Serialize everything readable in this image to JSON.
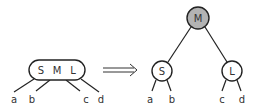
{
  "diagram": {
    "type": "tree-transformation",
    "colors": {
      "stroke": "#222222",
      "node_fill": "#ffffff",
      "root_fill": "#b3b3b3",
      "text": "#333333"
    },
    "left": {
      "node": {
        "keys": [
          "S",
          "M",
          "L"
        ]
      },
      "children": [
        "a",
        "b",
        "c",
        "d"
      ]
    },
    "arrow": {
      "symbol": "⟹"
    },
    "right": {
      "root": {
        "label": "M"
      },
      "left_child": {
        "label": "S",
        "children": [
          "a",
          "b"
        ]
      },
      "right_child": {
        "label": "L",
        "children": [
          "c",
          "d"
        ]
      }
    }
  }
}
